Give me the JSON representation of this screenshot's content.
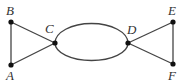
{
  "diagram": {
    "type": "graph",
    "colors": {
      "edge": "#444444",
      "node": "#111111",
      "label": "#333333",
      "background": "#ffffff"
    },
    "nodes": [
      {
        "id": "A",
        "label": "A",
        "x": 11,
        "y": 65
      },
      {
        "id": "B",
        "label": "B",
        "x": 11,
        "y": 22
      },
      {
        "id": "C",
        "label": "C",
        "x": 55,
        "y": 43
      },
      {
        "id": "D",
        "label": "D",
        "x": 128,
        "y": 43
      },
      {
        "id": "E",
        "label": "E",
        "x": 173,
        "y": 22
      },
      {
        "id": "F",
        "label": "F",
        "x": 173,
        "y": 64
      }
    ],
    "edges": [
      {
        "from": "A",
        "to": "B",
        "shape": "line"
      },
      {
        "from": "B",
        "to": "C",
        "shape": "line"
      },
      {
        "from": "A",
        "to": "C",
        "shape": "line"
      },
      {
        "from": "C",
        "to": "D",
        "shape": "upper-arc"
      },
      {
        "from": "C",
        "to": "D",
        "shape": "lower-arc"
      },
      {
        "from": "D",
        "to": "E",
        "shape": "line"
      },
      {
        "from": "D",
        "to": "F",
        "shape": "line"
      },
      {
        "from": "E",
        "to": "F",
        "shape": "line"
      }
    ],
    "labels": {
      "A": "A",
      "B": "B",
      "C": "C",
      "D": "D",
      "E": "E",
      "F": "F"
    }
  }
}
